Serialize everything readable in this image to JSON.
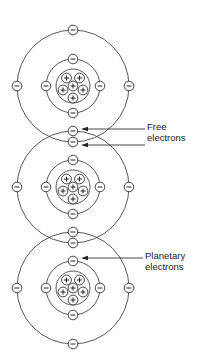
{
  "diagram": {
    "colors": {
      "line": "#444444",
      "background": "#ffffff"
    },
    "atoms": [
      {
        "cx": 73,
        "cy": 86
      },
      {
        "cx": 73,
        "cy": 187
      },
      {
        "cx": 73,
        "cy": 288
      }
    ],
    "outer_orbit_radius": 56,
    "inner_orbit_radius": 27,
    "nucleus_radius": 17,
    "protons_per_atom": 6,
    "electron_symbol": "−",
    "proton_symbol": "+",
    "labels": [
      {
        "id": "free",
        "lines": [
          "Free",
          "electrons"
        ]
      },
      {
        "id": "planetary",
        "lines": [
          "Planetary",
          "electrons"
        ]
      }
    ],
    "arrows": [
      {
        "label": "free",
        "y": 129,
        "x_start": 145,
        "x_end": 81
      },
      {
        "label": "free",
        "y": 145,
        "x_start": 145,
        "x_end": 81
      },
      {
        "label": "planetary",
        "y": 258,
        "x_start": 143,
        "x_end": 81
      }
    ]
  }
}
